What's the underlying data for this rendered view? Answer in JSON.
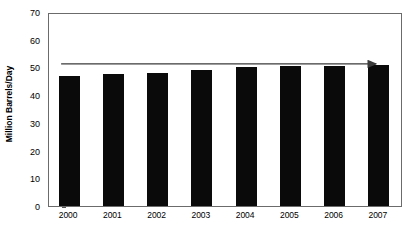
{
  "chart_data": {
    "type": "bar",
    "title": "",
    "subtitle": "",
    "xlabel": "",
    "ylabel": "Million Barrels/Day",
    "categories": [
      "2000",
      "2001",
      "2002",
      "2003",
      "2004",
      "2005",
      "2006",
      "2007"
    ],
    "values": [
      47.0,
      47.5,
      48.0,
      49.0,
      50.0,
      50.5,
      50.5,
      51.0
    ],
    "series": [
      {
        "name": "Million Barrels/Day",
        "values": [
          47.0,
          47.5,
          48.0,
          49.0,
          50.0,
          50.5,
          50.5,
          51.0
        ],
        "color": "#0a0a0a"
      }
    ],
    "ylim": [
      0,
      70
    ],
    "ytick_values": [
      0,
      10,
      20,
      30,
      40,
      50,
      60,
      70
    ],
    "ytick_labels": [
      "0",
      "10",
      "20",
      "30",
      "40",
      "50",
      "60",
      "70"
    ],
    "ytick_interval": 10,
    "grid": false,
    "legend": false,
    "legend_position": "none",
    "bar_color": "#0a0a0a",
    "frame_color": "#6b6b6b",
    "annotations": [
      {
        "type": "arrow",
        "name": "rising-trend-arrow",
        "label": "",
        "direction": "right",
        "y_value": 52,
        "x_start_category": "2000",
        "x_end_category": "2007",
        "color": "#3a3a3a"
      }
    ]
  }
}
